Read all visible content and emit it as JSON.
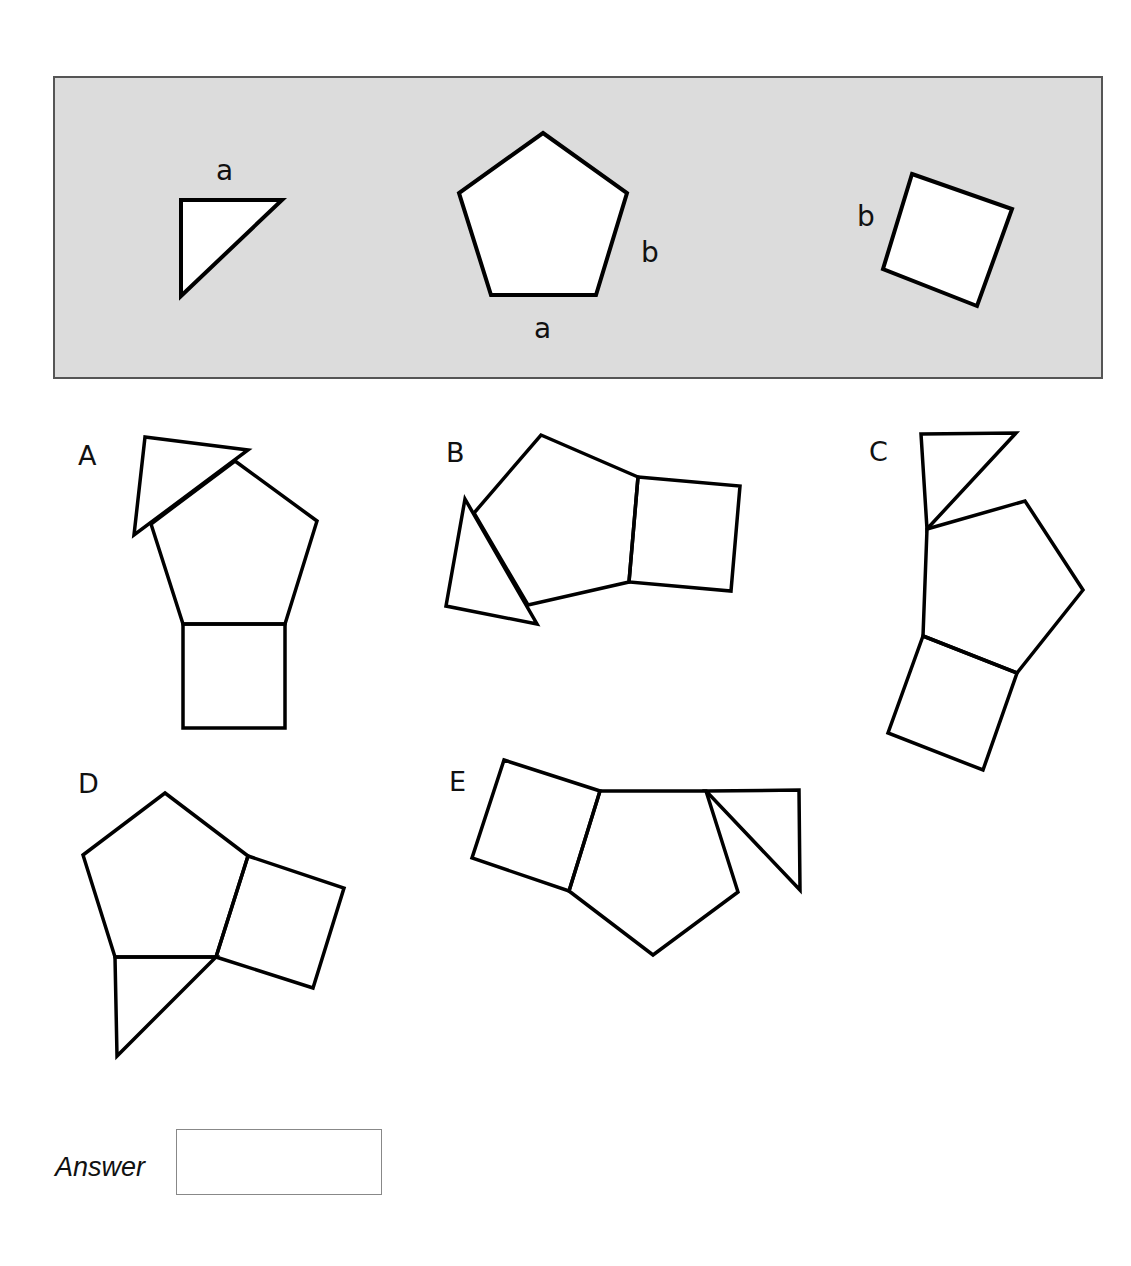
{
  "reference_panel": {
    "background": "#dcdcdc",
    "shapes": [
      {
        "name": "triangle",
        "label": "a",
        "label_edge": "top",
        "points": "181,200 282,200 181,296"
      },
      {
        "name": "pentagon",
        "labels": [
          {
            "text": "b",
            "edge": "right-lower"
          },
          {
            "text": "a",
            "edge": "bottom"
          }
        ],
        "points": "543,133 627,193 596,295 491,295 459,193"
      },
      {
        "name": "square",
        "label": "b",
        "label_edge": "left-upper",
        "points": "912,174 1012,209 977,306 883,269"
      }
    ],
    "labels": {
      "triangle_a": "a",
      "pentagon_b": "b",
      "pentagon_a": "a",
      "square_b": "b"
    }
  },
  "options": [
    {
      "letter": "A",
      "pentagon": "235,461 317,521 285,624 183,624 151,524",
      "square": "183,624 285,624 285,728 183,728",
      "triangle": "145,437 248,450 134,535"
    },
    {
      "letter": "B",
      "pentagon": "541,435 638,477 629,582 528,605 474,513",
      "square": "638,477 740,486 731,591 629,582",
      "triangle": "465,499 537,624 446,606"
    },
    {
      "letter": "C",
      "pentagon": "927,529 1025,501 1083,590 1017,673 923,636",
      "square": "923,636 1017,673 983,770 888,733",
      "triangle": "921,434 1016,433 927,529"
    },
    {
      "letter": "D",
      "pentagon": "165,793 248,856 216,957 115,957 83,855",
      "square": "248,856 344,888 313,988 216,957",
      "triangle": "115,957 216,957 117,1056"
    },
    {
      "letter": "E",
      "pentagon": "600,791 706,791 738,892 653,955 569,891",
      "square": "504,760 600,791 569,891 472,858",
      "triangle": "706,791 799,790 800,890"
    }
  ],
  "answer": {
    "label": "Answer",
    "value": ""
  }
}
